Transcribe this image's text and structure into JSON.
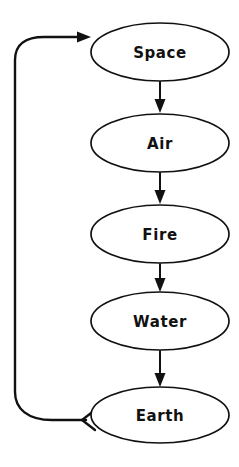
{
  "diagram": {
    "type": "cyclic-flowchart",
    "orientation": "vertical",
    "background_color": "#ffffff",
    "stroke_color": "#111111",
    "node_fill_color": "#ffffff",
    "nodes": [
      {
        "id": "space",
        "label": "Space",
        "cx": 160,
        "cy": 52,
        "rx": 69,
        "ry": 29
      },
      {
        "id": "air",
        "label": "Air",
        "cx": 160,
        "cy": 143,
        "rx": 69,
        "ry": 29
      },
      {
        "id": "fire",
        "label": "Fire",
        "cx": 160,
        "cy": 234,
        "rx": 69,
        "ry": 29
      },
      {
        "id": "water",
        "label": "Water",
        "cx": 160,
        "cy": 321,
        "rx": 69,
        "ry": 29
      },
      {
        "id": "earth",
        "label": "Earth",
        "cx": 160,
        "cy": 415,
        "rx": 69,
        "ry": 28
      }
    ],
    "edges": [
      {
        "id": "space-to-air",
        "from": "space",
        "to": "air",
        "arrowhead": "solid-triangle",
        "direction": "down"
      },
      {
        "id": "air-to-fire",
        "from": "air",
        "to": "fire",
        "arrowhead": "solid-triangle",
        "direction": "down"
      },
      {
        "id": "fire-to-water",
        "from": "fire",
        "to": "water",
        "arrowhead": "solid-triangle",
        "direction": "down"
      },
      {
        "id": "water-to-earth",
        "from": "water",
        "to": "earth",
        "arrowhead": "solid-triangle",
        "direction": "down"
      },
      {
        "id": "earth-to-space",
        "from": "earth",
        "to": "space",
        "arrowhead": "solid-triangle",
        "direction": "loop-left-up"
      }
    ],
    "return_loop": {
      "id": "earth-to-space-loop",
      "tail_arrowhead": "open-chevron",
      "tail_at": "earth",
      "head_arrowhead": "solid-triangle",
      "head_at": "space"
    }
  }
}
